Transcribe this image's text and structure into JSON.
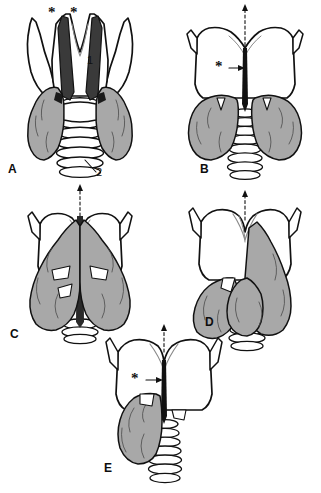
{
  "figure": {
    "kind": "anatomical-line-drawing",
    "background_color": "#ffffff",
    "outline_color": "#111111",
    "gland_fill_color": "#a8a8a8",
    "cartilage_fill_color": "#ffffff",
    "trachea_fill_color": "#ffffff",
    "width": 321,
    "height": 493
  },
  "panels": [
    {
      "id": "A",
      "letter": "A",
      "markers": {
        "asterisks": [
          "*",
          "*"
        ],
        "numbers": [
          "1",
          "2"
        ],
        "dashed_arrow": false
      }
    },
    {
      "id": "B",
      "letter": "B",
      "markers": {
        "asterisks": [
          "*"
        ],
        "numbers": [],
        "dashed_arrow": true
      }
    },
    {
      "id": "C",
      "letter": "C",
      "markers": {
        "asterisks": [],
        "numbers": [],
        "dashed_arrow": true
      }
    },
    {
      "id": "D",
      "letter": "D",
      "markers": {
        "asterisks": [],
        "numbers": [],
        "dashed_arrow": true
      }
    },
    {
      "id": "E",
      "letter": "E",
      "markers": {
        "asterisks": [
          "*"
        ],
        "numbers": [],
        "dashed_arrow": true
      }
    }
  ]
}
